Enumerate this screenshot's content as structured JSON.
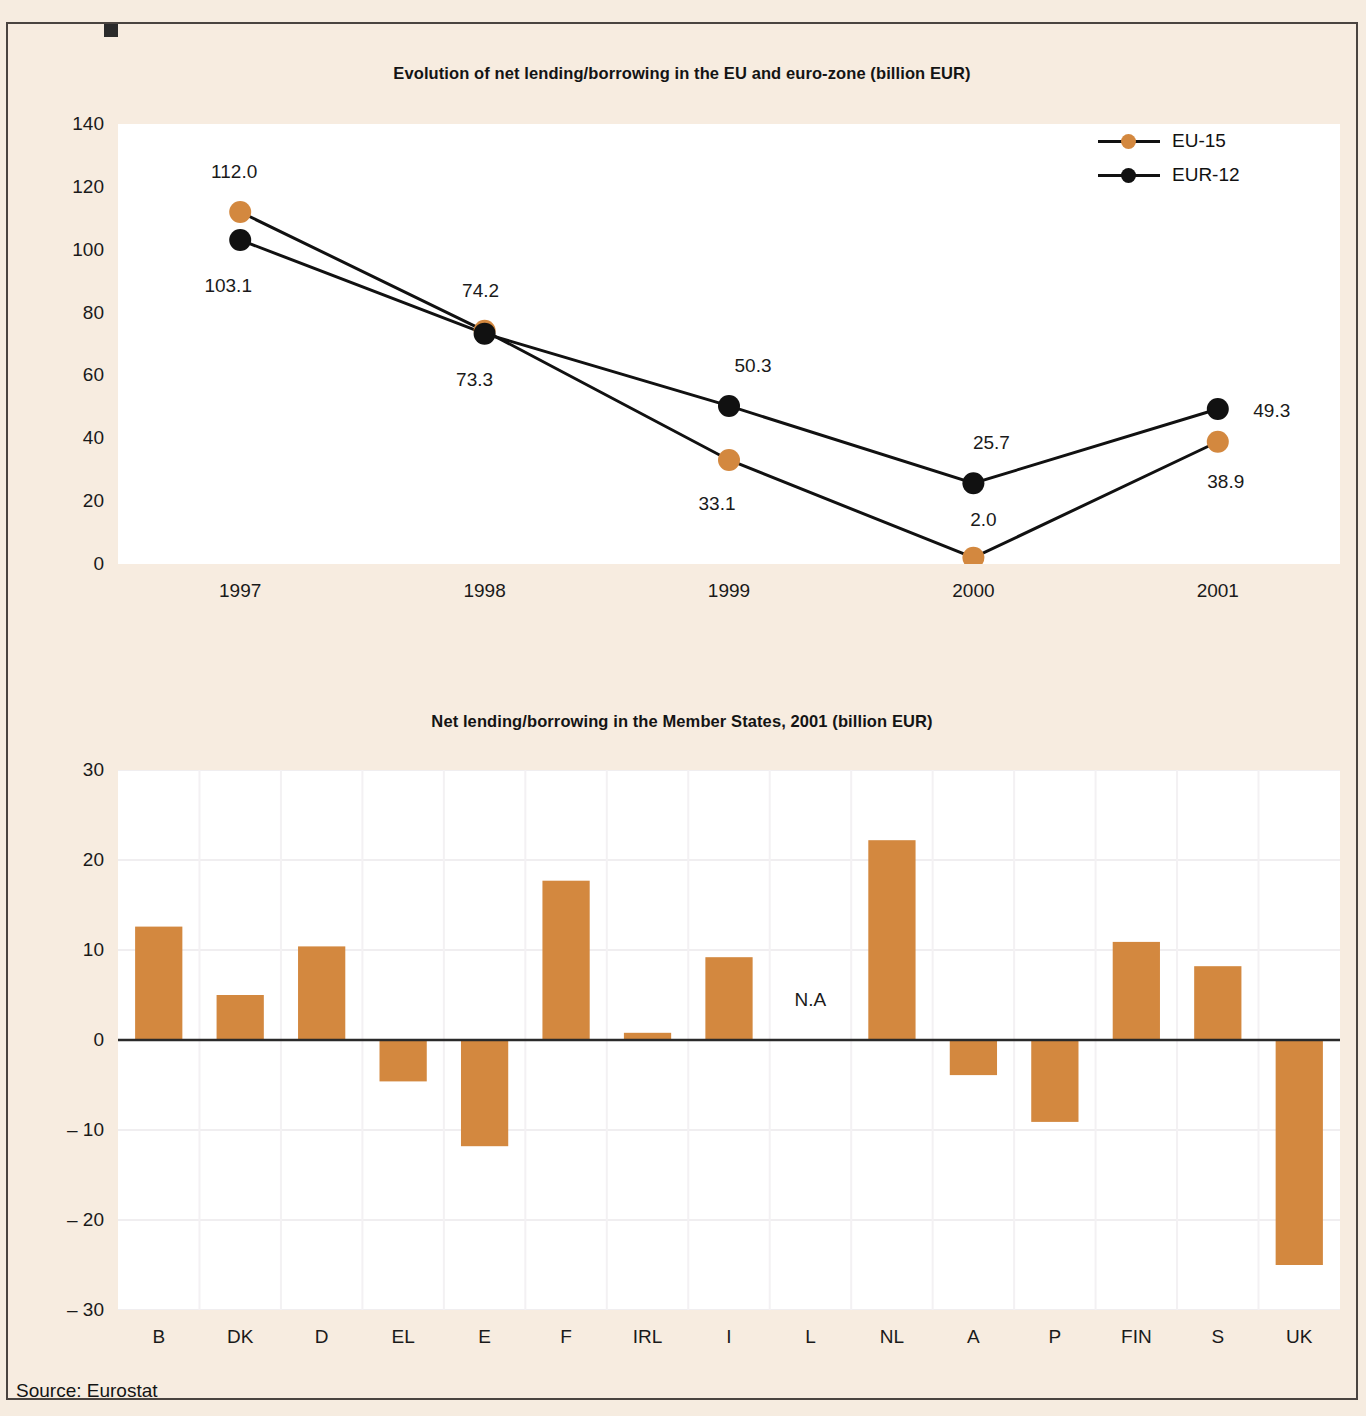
{
  "figure": {
    "background_color": "#f6ece0",
    "accent_color": "#d3883f",
    "series_black_color": "#111111",
    "source_text": "Source: Eurostat"
  },
  "charts": {
    "line": {
      "title": "Evolution of net lending/borrowing in the EU and euro-zone (billion EUR)",
      "legend": [
        {
          "label": "EU-15",
          "color": "#d3883f"
        },
        {
          "label": "EUR-12",
          "color": "#111111"
        }
      ]
    },
    "bar": {
      "title": "Net lending/borrowing in the Member States, 2001 (billion EUR)",
      "na_label": "N.A"
    }
  },
  "chart_data": [
    {
      "type": "line",
      "title": "Evolution of net lending/borrowing in the EU and euro-zone (billion EUR)",
      "xlabel": "",
      "ylabel": "",
      "categories": [
        "1997",
        "1998",
        "1999",
        "2000",
        "2001"
      ],
      "ylim": [
        0,
        140
      ],
      "yticks": [
        0,
        20,
        40,
        60,
        80,
        100,
        120,
        140
      ],
      "ytick_labels": [
        "0",
        "20",
        "40",
        "60",
        "80",
        "100",
        "120",
        "140"
      ],
      "grid": false,
      "legend_position": "top-right",
      "series": [
        {
          "name": "EU-15",
          "color": "#d3883f",
          "values": [
            112.0,
            74.2,
            33.1,
            2.0,
            38.9
          ],
          "labels": [
            "112.0",
            "74.2",
            "33.1",
            "2.0",
            "38.9"
          ]
        },
        {
          "name": "EUR-12",
          "color": "#111111",
          "values": [
            103.1,
            73.3,
            50.3,
            25.7,
            49.3
          ],
          "labels": [
            "103.1",
            "73.3",
            "50.3",
            "25.7",
            "49.3"
          ]
        }
      ]
    },
    {
      "type": "bar",
      "title": "Net lending/borrowing in the Member States, 2001 (billion EUR)",
      "xlabel": "",
      "ylabel": "",
      "categories": [
        "B",
        "DK",
        "D",
        "EL",
        "E",
        "F",
        "IRL",
        "I",
        "L",
        "NL",
        "A",
        "P",
        "FIN",
        "S",
        "UK"
      ],
      "values": [
        12.6,
        5.0,
        10.4,
        -4.6,
        -11.8,
        17.7,
        0.8,
        9.2,
        null,
        22.2,
        -3.9,
        -9.1,
        10.9,
        8.2,
        -25.0
      ],
      "annotations": [
        {
          "category": "L",
          "text": "N.A",
          "value": 4.5
        }
      ],
      "ylim": [
        -30,
        30
      ],
      "yticks": [
        30,
        20,
        10,
        0,
        -10,
        -20,
        -30
      ],
      "ytick_labels": [
        "30",
        "20",
        "10",
        "0",
        "– 10",
        "– 20",
        "– 30"
      ],
      "grid": true,
      "bar_color": "#d3883f"
    }
  ]
}
